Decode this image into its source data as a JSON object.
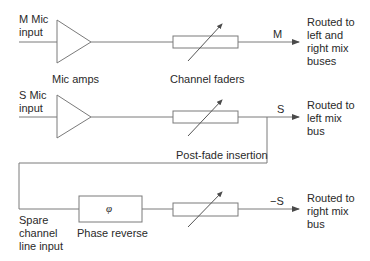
{
  "diagram": {
    "type": "signal-flow",
    "title": "",
    "stroke_color": "#7a7a7a",
    "text_color": "#2a2a2a",
    "rows": [
      {
        "id": "m-channel",
        "input_label": "M Mic\ninput",
        "amp_label": "Mic amps",
        "fader_label": "Channel faders",
        "signal_label": "M",
        "destination": "Routed to\nleft and\nright mix\nbuses"
      },
      {
        "id": "s-channel",
        "input_label": "S Mic\ninput",
        "signal_label": "S",
        "destination": "Routed to\nleft mix\nbus",
        "branch_label": "Post-fade insertion"
      },
      {
        "id": "spare-channel",
        "input_label": "Spare\nchannel\nline input",
        "phase_symbol": "φ",
        "phase_label": "Phase reverse",
        "signal_label": "−S",
        "destination": "Routed to\nright mix\nbus"
      }
    ],
    "nodes": [
      {
        "id": "amp-m",
        "kind": "amplifier"
      },
      {
        "id": "fader-m",
        "kind": "variable-fader"
      },
      {
        "id": "amp-s",
        "kind": "amplifier"
      },
      {
        "id": "fader-s",
        "kind": "variable-fader"
      },
      {
        "id": "phase-reverse",
        "kind": "box",
        "symbol": "φ"
      },
      {
        "id": "fader-spare",
        "kind": "variable-fader"
      }
    ],
    "edges": [
      {
        "from": "M Mic input",
        "to": "amp-m"
      },
      {
        "from": "amp-m",
        "to": "fader-m"
      },
      {
        "from": "fader-m",
        "to": "left and right mix buses",
        "label": "M"
      },
      {
        "from": "S Mic input",
        "to": "amp-s"
      },
      {
        "from": "amp-s",
        "to": "fader-s"
      },
      {
        "from": "fader-s",
        "to": "left mix bus",
        "label": "S"
      },
      {
        "from": "fader-s",
        "to": "spare channel line input",
        "label": "Post-fade insertion"
      },
      {
        "from": "spare channel line input",
        "to": "phase-reverse"
      },
      {
        "from": "phase-reverse",
        "to": "fader-spare"
      },
      {
        "from": "fader-spare",
        "to": "right mix bus",
        "label": "−S"
      }
    ]
  }
}
